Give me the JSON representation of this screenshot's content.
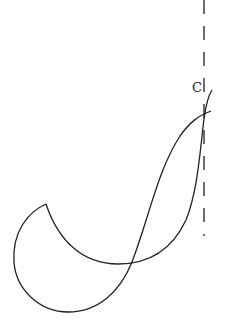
{
  "diagram": {
    "title": "",
    "stroke_color": "#222222",
    "background": "#ffffff",
    "labels": [
      {
        "id": "point-c",
        "text": "C",
        "x": 192,
        "y": 80
      }
    ],
    "axis": {
      "style": "dashed",
      "x": 204,
      "y_start": 0,
      "y_end": 236
    }
  }
}
